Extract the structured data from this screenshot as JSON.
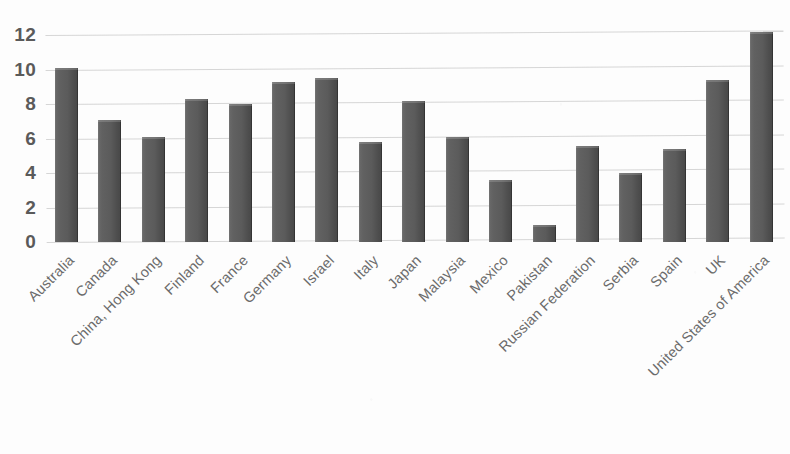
{
  "chart_data": {
    "type": "bar",
    "title": "",
    "subtitle": "",
    "xlabel": "",
    "ylabel": "",
    "ylim": [
      0,
      13
    ],
    "grid": true,
    "legend": false,
    "legend_position": "none",
    "bar_color": "#5f5f5f",
    "gridline_color": "#cfcfcf",
    "background_color": "#fdfdfd",
    "tick_label_color": "#6b6b6b",
    "y_ticks": [
      "0",
      "2",
      "4",
      "6",
      "8",
      "10",
      "12"
    ],
    "y_tick_values": [
      0,
      2,
      4,
      6,
      8,
      10,
      12
    ],
    "categories": [
      "Australia",
      "Canada",
      "China, Hong Kong",
      "Finland",
      "France",
      "Germany",
      "Israel",
      "Italy",
      "Japan",
      "Malaysia",
      "Mexico",
      "Pakistan",
      "Russian Federation",
      "Serbia",
      "Spain",
      "UK",
      "United States of America"
    ],
    "values": [
      10.1,
      7.1,
      6.1,
      8.3,
      8.0,
      9.3,
      9.5,
      5.8,
      8.2,
      6.1,
      3.6,
      1.0,
      5.6,
      4.0,
      5.4,
      9.4,
      12.2
    ]
  }
}
